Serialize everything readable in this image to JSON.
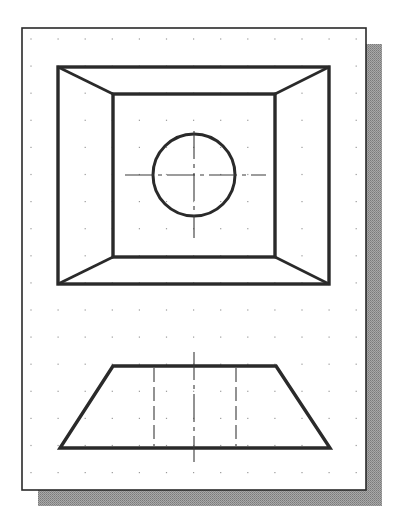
{
  "figure": {
    "colors": {
      "background": "#ffffff",
      "sheet": "#ffffff",
      "sheet_border": "#2a2a2a",
      "shadow": "#9a9a9a",
      "object_line": "#2a2a2a",
      "center_line": "#3a3a3a",
      "hidden_line": "#3a3a3a",
      "grid_dot": "#9a9a9a"
    },
    "sheet": {
      "x": 22,
      "y": 28,
      "width": 344,
      "height": 462
    },
    "shadow": {
      "dx": 16,
      "dy": 16
    },
    "grid": {
      "start_x": 31,
      "start_y": 39,
      "spacing": 27.1,
      "cols": 13,
      "rows": 17
    }
  },
  "top_view": {
    "outer_rect": {
      "x1": 58,
      "y1": 67,
      "x2": 329,
      "y2": 284
    },
    "inner_rect": {
      "x1": 113,
      "y1": 94,
      "x2": 275,
      "y2": 257
    },
    "hole": {
      "cx": 194,
      "cy": 175,
      "r": 41
    },
    "center_lines": {
      "h": {
        "x1": 125,
        "x2": 266,
        "y": 175
      },
      "v": {
        "x": 194,
        "y1": 131,
        "y2": 238
      }
    }
  },
  "front_view": {
    "trapezoid": {
      "top_x1": 113,
      "top_x2": 276,
      "top_y": 366,
      "bottom_x1": 60,
      "bottom_x2": 330,
      "bottom_y": 448
    },
    "hidden_lines": [
      {
        "x": 154
      },
      {
        "x": 236
      }
    ],
    "center_line": {
      "x": 194,
      "y1": 352,
      "y2": 462
    }
  }
}
